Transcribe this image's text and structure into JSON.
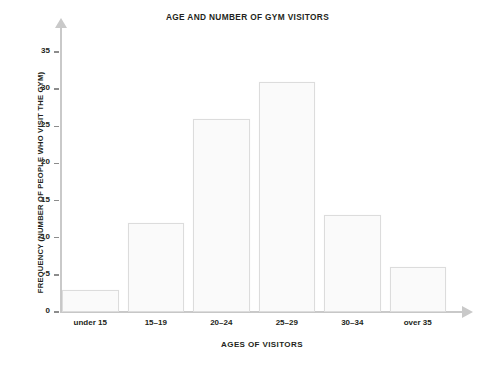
{
  "chart_data": {
    "type": "bar",
    "title": "AGE AND NUMBER OF GYM VISITORS",
    "xlabel": "AGES OF VISITORS",
    "ylabel": "FREQUENCY (NUMBER OF PEOPLE WHO VISIT THE GYM)",
    "categories": [
      "under 15",
      "15–19",
      "20–24",
      "25–29",
      "30–34",
      "over 35"
    ],
    "values": [
      3,
      12,
      26,
      31,
      13,
      6
    ],
    "ylim": [
      0,
      35
    ],
    "ytick_labels": [
      "0",
      "5",
      "10",
      "15",
      "20",
      "25",
      "30",
      "35"
    ],
    "ytick_values": [
      0,
      5,
      10,
      15,
      20,
      25,
      30,
      35
    ],
    "grid": false,
    "legend": false,
    "bar_fill_color": "#fafafa",
    "bar_border_color": "#dcdcdc",
    "axis_color": "#c9c9c9",
    "text_color": "#231f20",
    "background_color": "#ffffff"
  }
}
